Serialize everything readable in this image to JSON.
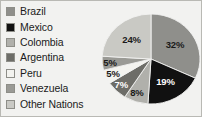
{
  "chart_data": {
    "type": "pie",
    "title": "",
    "xlabel": "",
    "ylabel": "",
    "legend_position": "left",
    "grid": false,
    "categories": [
      "Brazil",
      "Mexico",
      "Colombia",
      "Argentina",
      "Peru",
      "Venezuela",
      "Other Nations"
    ],
    "values": [
      32,
      19,
      8,
      7,
      5,
      5,
      24
    ],
    "data_labels": [
      "32%",
      "19%",
      "8%",
      "7%",
      "5%",
      "5%",
      "24%"
    ],
    "units": "percent",
    "total": 100,
    "slice_colors": [
      "#8f8f8b",
      "#111111",
      "#b0b0ab",
      "#6d6d68",
      "#f3f3ef",
      "#9a9a95",
      "#c9c9c4"
    ],
    "start_angle_deg": 0,
    "direction": "clockwise"
  },
  "legend": {
    "items": [
      {
        "label": "Brazil",
        "color": "#8f8f8b",
        "value": 32
      },
      {
        "label": "Mexico",
        "color": "#111111",
        "value": 19
      },
      {
        "label": "Colombia",
        "color": "#b0b0ab",
        "value": 8
      },
      {
        "label": "Argentina",
        "color": "#6d6d68",
        "value": 7
      },
      {
        "label": "Peru",
        "color": "#f3f3ef",
        "value": 5
      },
      {
        "label": "Venezuela",
        "color": "#9a9a95",
        "value": 5
      },
      {
        "label": "Other Nations",
        "color": "#c9c9c4",
        "value": 24
      }
    ]
  },
  "figure": {
    "background": "#f2f2f0",
    "border_color": "#b9b9b4"
  }
}
